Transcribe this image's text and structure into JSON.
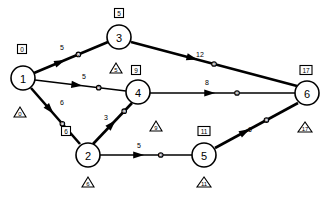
{
  "diagram": {
    "type": "activity-on-arrow-network",
    "title": "",
    "nodes": [
      {
        "id": "1",
        "label": "1",
        "cx": 23,
        "cy": 78,
        "r": 12,
        "early_label": "0",
        "early_x": 22,
        "early_y": 49,
        "late_label": "0",
        "late_x": 20,
        "late_y": 112
      },
      {
        "id": "2",
        "label": "2",
        "cx": 88,
        "cy": 155,
        "r": 12,
        "early_label": "6",
        "early_x": 66,
        "early_y": 131,
        "late_label": "6",
        "late_x": 88,
        "late_y": 182
      },
      {
        "id": "3",
        "label": "3",
        "cx": 119,
        "cy": 37,
        "r": 12,
        "early_label": "5",
        "early_x": 119,
        "early_y": 13,
        "late_label": "5",
        "late_x": 116,
        "late_y": 68
      },
      {
        "id": "4",
        "label": "4",
        "cx": 138,
        "cy": 92,
        "r": 12,
        "early_label": "9",
        "early_x": 136,
        "early_y": 70,
        "late_label": "9",
        "late_x": 156,
        "late_y": 126
      },
      {
        "id": "5",
        "label": "5",
        "cx": 204,
        "cy": 155,
        "r": 12,
        "early_label": "11",
        "early_x": 204,
        "early_y": 131,
        "late_label": "11",
        "late_x": 204,
        "late_y": 182
      },
      {
        "id": "6",
        "label": "6",
        "cx": 307,
        "cy": 93,
        "r": 12,
        "early_label": "17",
        "early_x": 306,
        "early_y": 70,
        "late_label": "17",
        "late_x": 305,
        "late_y": 127
      }
    ],
    "edges": [
      {
        "id": "e13",
        "from": "1",
        "to": "3",
        "weight": "5",
        "style": "thick",
        "x1": 34,
        "y1": 73,
        "x2": 108,
        "y2": 42,
        "label_x": 62,
        "label_y": 50,
        "arrow_t": 0.42,
        "dot_t": 0.6,
        "dot_label": "0"
      },
      {
        "id": "e14",
        "from": "1",
        "to": "4",
        "weight": "5",
        "style": "thin",
        "x1": 35,
        "y1": 80,
        "x2": 126,
        "y2": 91,
        "label_x": 84,
        "label_y": 79,
        "arrow_t": 0.52,
        "dot_t": 0.7,
        "dot_label": "0"
      },
      {
        "id": "e12",
        "from": "1",
        "to": "2",
        "weight": "6",
        "style": "thick",
        "x1": 31,
        "y1": 88,
        "x2": 80,
        "y2": 144,
        "label_x": 62,
        "label_y": 105,
        "arrow_t": 0.46,
        "dot_t": 0.64,
        "dot_label": "0"
      },
      {
        "id": "e36",
        "from": "3",
        "to": "6",
        "weight": "12",
        "style": "thick",
        "x1": 131,
        "y1": 42,
        "x2": 297,
        "y2": 86,
        "label_x": 200,
        "label_y": 57,
        "arrow_t": 0.4,
        "dot_t": 0.5,
        "dot_label": "0"
      },
      {
        "id": "e46",
        "from": "4",
        "to": "6",
        "weight": "8",
        "style": "thin",
        "x1": 150,
        "y1": 93,
        "x2": 295,
        "y2": 93,
        "label_x": 207,
        "label_y": 85,
        "arrow_t": 0.45,
        "dot_t": 0.6,
        "dot_label": "0"
      },
      {
        "id": "e24",
        "from": "2",
        "to": "4",
        "weight": "3",
        "style": "thick",
        "x1": 93,
        "y1": 144,
        "x2": 132,
        "y2": 103,
        "label_x": 106,
        "label_y": 120,
        "arrow_t": 0.58,
        "dot_t": 0.8,
        "dot_label": "0"
      },
      {
        "id": "e25",
        "from": "2",
        "to": "5",
        "weight": "5",
        "style": "thin",
        "x1": 100,
        "y1": 155,
        "x2": 192,
        "y2": 155,
        "label_x": 139,
        "label_y": 148,
        "arrow_t": 0.48,
        "dot_t": 0.66,
        "dot_label": "0"
      },
      {
        "id": "e56",
        "from": "5",
        "to": "6",
        "weight": "6",
        "style": "thick",
        "x1": 215,
        "y1": 148,
        "x2": 298,
        "y2": 103,
        "label_x": 250,
        "label_y": 132,
        "arrow_t": 0.42,
        "dot_t": 0.62,
        "dot_label": "0"
      }
    ]
  }
}
